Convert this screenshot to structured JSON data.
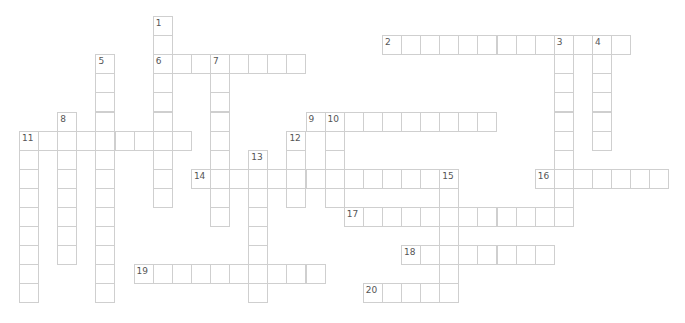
{
  "puzzle": {
    "grid": {
      "origin_x": 19,
      "origin_y": 16,
      "cell_size": 19.1
    },
    "entries": [
      {
        "number": "1",
        "direction": "down",
        "col": 7,
        "row": 0,
        "length": 10
      },
      {
        "number": "2",
        "direction": "across",
        "col": 19,
        "row": 1,
        "length": 13
      },
      {
        "number": "3",
        "direction": "down",
        "col": 28,
        "row": 1,
        "length": 10
      },
      {
        "number": "4",
        "direction": "down",
        "col": 30,
        "row": 1,
        "length": 6
      },
      {
        "number": "5",
        "direction": "down",
        "col": 4,
        "row": 2,
        "length": 13
      },
      {
        "number": "6",
        "direction": "across",
        "col": 7,
        "row": 2,
        "length": 8
      },
      {
        "number": "7",
        "direction": "down",
        "col": 10,
        "row": 2,
        "length": 9
      },
      {
        "number": "8",
        "direction": "down",
        "col": 2,
        "row": 5,
        "length": 8
      },
      {
        "number": "9",
        "direction": "across",
        "col": 15,
        "row": 5,
        "length": 10
      },
      {
        "number": "10",
        "direction": "down",
        "col": 16,
        "row": 5,
        "length": 5
      },
      {
        "number": "11",
        "direction": "across",
        "col": 0,
        "row": 6,
        "length": 9
      },
      {
        "number": "11",
        "direction": "down",
        "col": 0,
        "row": 6,
        "length": 9
      },
      {
        "number": "12",
        "direction": "down",
        "col": 14,
        "row": 6,
        "length": 4
      },
      {
        "number": "13",
        "direction": "down",
        "col": 12,
        "row": 7,
        "length": 8
      },
      {
        "number": "14",
        "direction": "across",
        "col": 9,
        "row": 8,
        "length": 14
      },
      {
        "number": "15",
        "direction": "down",
        "col": 22,
        "row": 8,
        "length": 7
      },
      {
        "number": "16",
        "direction": "across",
        "col": 27,
        "row": 8,
        "length": 7
      },
      {
        "number": "17",
        "direction": "across",
        "col": 17,
        "row": 10,
        "length": 12
      },
      {
        "number": "18",
        "direction": "across",
        "col": 20,
        "row": 12,
        "length": 8
      },
      {
        "number": "19",
        "direction": "across",
        "col": 6,
        "row": 13,
        "length": 10
      },
      {
        "number": "20",
        "direction": "across",
        "col": 18,
        "row": 14,
        "length": 5
      }
    ]
  }
}
